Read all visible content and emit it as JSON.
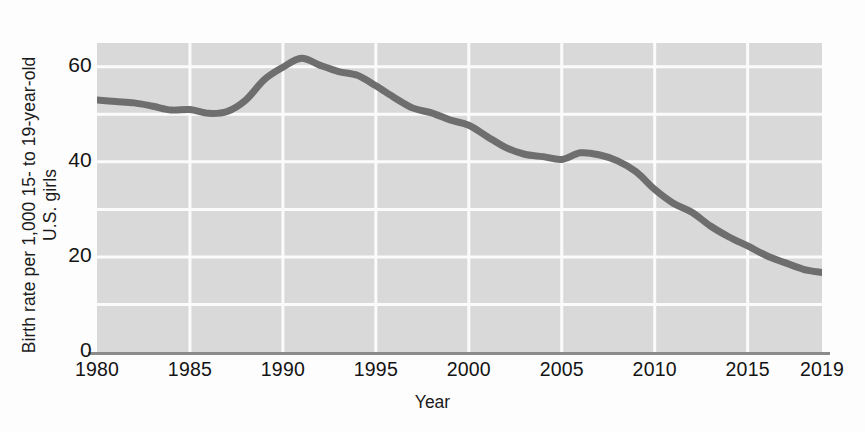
{
  "chart_data": {
    "type": "line",
    "title": "",
    "subtitle": "",
    "xlabel": "Year",
    "ylabel_line1": "Birth rate per 1,000 15- to 19-year-old",
    "ylabel_line2": "U.S. girls",
    "xlim": [
      1980,
      2019
    ],
    "ylim": [
      0,
      65
    ],
    "xticks": [
      "1980",
      "1985",
      "1990",
      "1995",
      "2000",
      "2005",
      "2010",
      "2015",
      "2019"
    ],
    "xtick_values": [
      1980,
      1985,
      1990,
      1995,
      2000,
      2005,
      2010,
      2015,
      2019
    ],
    "yticks": [
      "60",
      "40",
      "20",
      "0"
    ],
    "ytick_values": [
      60,
      40,
      20,
      0
    ],
    "grid": "both",
    "grid_y_values": [
      60,
      50,
      40,
      30,
      20,
      10
    ],
    "grid_x_values": [
      1985,
      1990,
      1995,
      2000,
      2005,
      2010,
      2015
    ],
    "legend": "none",
    "line_color": "#6e6e6e",
    "plot_background": "#d9d9d9",
    "grid_color": "#fbfbfb",
    "axis_color": "#8c8c8c",
    "text_color": "#141414",
    "series": [
      {
        "name": "U.S. teen birth rate",
        "x": [
          1980,
          1981,
          1982,
          1983,
          1984,
          1985,
          1986,
          1987,
          1988,
          1989,
          1990,
          1991,
          1992,
          1993,
          1994,
          1995,
          1996,
          1997,
          1998,
          1999,
          2000,
          2001,
          2002,
          2003,
          2004,
          2005,
          2006,
          2007,
          2008,
          2009,
          2010,
          2011,
          2012,
          2013,
          2014,
          2015,
          2016,
          2017,
          2018,
          2019
        ],
        "values": [
          53.0,
          52.7,
          52.4,
          51.7,
          50.9,
          51.0,
          50.2,
          50.6,
          53.0,
          57.3,
          59.9,
          61.8,
          60.3,
          59.0,
          58.2,
          56.0,
          53.5,
          51.3,
          50.3,
          48.8,
          47.7,
          45.3,
          43.0,
          41.6,
          41.1,
          40.5,
          41.9,
          41.5,
          40.2,
          37.9,
          34.2,
          31.3,
          29.4,
          26.5,
          24.2,
          22.3,
          20.3,
          18.8,
          17.4,
          16.7
        ],
        "color": "#6e6e6e",
        "line_width": 7
      }
    ]
  }
}
